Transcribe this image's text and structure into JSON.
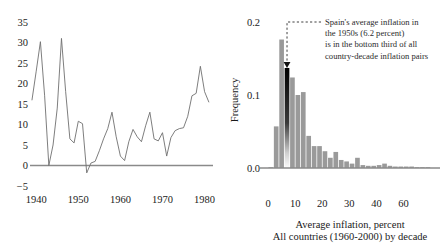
{
  "figure": {
    "panels": [
      "spain-inflation-timeseries",
      "all-countries-inflation-histogram"
    ]
  },
  "chart_data": [
    {
      "id": "spain-inflation-timeseries",
      "type": "line",
      "title": "",
      "xlabel": "",
      "ylabel": "",
      "xlim": [
        1939,
        1982
      ],
      "ylim": [
        -5,
        35
      ],
      "grid": false,
      "legend": "none",
      "xticks": [
        1940,
        1950,
        1960,
        1970,
        1980
      ],
      "xticklabels": [
        "1940",
        "1950",
        "1960",
        "1970",
        "1980"
      ],
      "yticks": [
        -5,
        0,
        5,
        10,
        15,
        20,
        25,
        30,
        35
      ],
      "yticklabels": [
        "-5",
        "0",
        "5",
        "10",
        "15",
        "20",
        "25",
        "30",
        "35"
      ],
      "zero_line": 0,
      "series": [
        {
          "name": "Spain inflation rate, percent",
          "color": "#6f6f6f",
          "x": [
            1939,
            1940,
            1941,
            1942,
            1943,
            1944,
            1945,
            1946,
            1947,
            1948,
            1949,
            1950,
            1951,
            1952,
            1953,
            1954,
            1955,
            1956,
            1957,
            1958,
            1959,
            1960,
            1961,
            1962,
            1963,
            1964,
            1965,
            1966,
            1967,
            1968,
            1969,
            1970,
            1971,
            1972,
            1973,
            1974,
            1975,
            1976,
            1977,
            1978,
            1979,
            1980,
            1981
          ],
          "values": [
            16.0,
            23.0,
            30.2,
            17.0,
            0.0,
            5.0,
            14.0,
            31.0,
            18.0,
            6.5,
            5.5,
            10.8,
            10.2,
            -1.8,
            0.6,
            1.0,
            3.6,
            6.5,
            9.0,
            13.0,
            7.0,
            2.3,
            1.2,
            5.8,
            8.8,
            7.0,
            5.8,
            9.7,
            13.0,
            6.5,
            6.0,
            8.0,
            2.3,
            6.8,
            8.5,
            9.0,
            9.2,
            12.0,
            17.0,
            17.6,
            24.2,
            18.0,
            15.5
          ]
        }
      ]
    },
    {
      "id": "all-countries-inflation-histogram",
      "type": "bar",
      "title": "",
      "xlabel": "Average inflation, percent",
      "xlabel2": "All countries (1960-2000) by decade",
      "ylabel": "Frequency",
      "xlim": [
        -1.5,
        62
      ],
      "ylim": [
        0,
        0.2
      ],
      "grid": false,
      "legend": "none",
      "xticks": [
        0,
        10,
        20,
        30,
        40,
        60
      ],
      "xticklabels": [
        "0",
        "10",
        "20",
        "30",
        "40",
        "60"
      ],
      "yticks": [
        0.0,
        0.1,
        0.2
      ],
      "yticklabels": [
        "0.0",
        "0.1",
        "0.2"
      ],
      "bin_width": 2,
      "bin_centers": [
        1,
        3,
        5,
        7,
        9,
        11,
        13,
        15,
        17,
        19,
        21,
        23,
        25,
        27,
        29,
        31,
        33,
        35,
        37,
        39,
        41,
        43,
        45,
        47,
        49,
        51,
        53,
        55,
        57,
        59
      ],
      "values": [
        0.001,
        0.057,
        0.176,
        0.137,
        0.124,
        0.1,
        0.104,
        0.044,
        0.03,
        0.03,
        0.023,
        0.014,
        0.022,
        0.011,
        0.009,
        0.006,
        0.014,
        0.004,
        0.003,
        0.003,
        0.004,
        0.006,
        0.003,
        0.002,
        0.002,
        0.002,
        0.002,
        0.001,
        0.001,
        0.001
      ],
      "highlight_bin_index": 3,
      "highlight_value": 6.2,
      "annotation": {
        "lines": [
          "Spain's average inflation in",
          "the 1950s (6.2 percent)",
          "is in the bottom third of all",
          "country-decade inflation pairs"
        ]
      }
    }
  ],
  "colors": {
    "bar": "#9a9a9a",
    "bar_highlight": "#111111",
    "line": "#6f6f6f",
    "axis": "#8a8a8a",
    "text": "#1a1a1a"
  }
}
